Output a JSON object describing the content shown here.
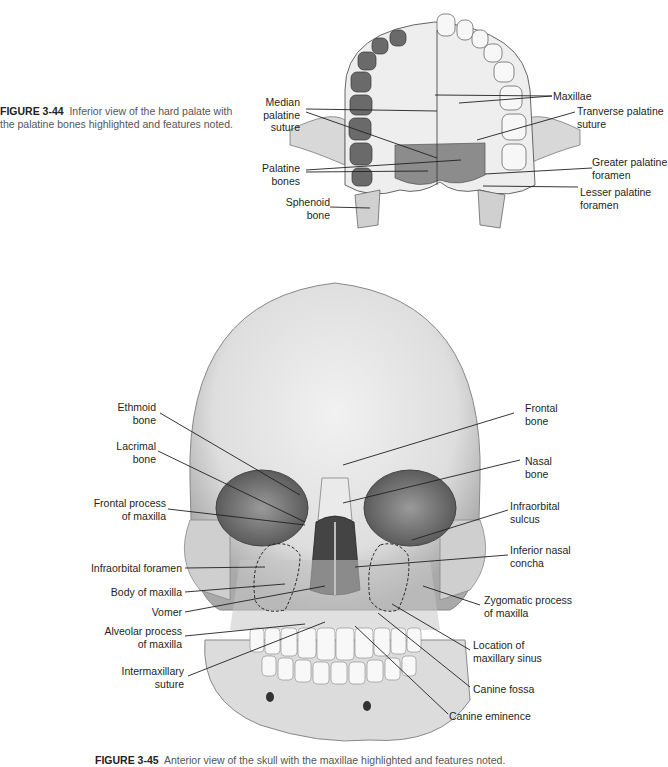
{
  "figure_344": {
    "caption_number": "FIGURE 3-44",
    "caption_text": "Inferior view of the hard palate with the palatine bones highlighted and features noted.",
    "labels": {
      "median_palatine_suture": "Median\npalatine\nsuture",
      "palatine_bones": "Palatine\nbones",
      "sphenoid_bone": "Sphenoid\nbone",
      "maxillae": "Maxillae",
      "tranverse_palatine_suture": "Tranverse palatine\nsuture",
      "greater_palatine_foramen": "Greater palatine\nforamen",
      "lesser_palatine_foramen": "Lesser palatine\nforamen"
    }
  },
  "figure_345": {
    "caption_number": "FIGURE 3-45",
    "caption_text": "Anterior view of the skull with the maxillae highlighted and features noted.",
    "labels": {
      "ethmoid_bone": "Ethmoid\nbone",
      "lacrimal_bone": "Lacrimal\nbone",
      "frontal_process": "Frontal process\nof maxilla",
      "infraorbital_foramen": "Infraorbital foramen",
      "body_of_maxilla": "Body of maxilla",
      "vomer": "Vomer",
      "alveolar_process": "Alveolar process\nof maxilla",
      "intermaxillary_suture": "Intermaxillary\nsuture",
      "frontal_bone": "Frontal\nbone",
      "nasal_bone": "Nasal\nbone",
      "infraorbital_sulcus": "Infraorbital\nsulcus",
      "inferior_nasal_concha": "Inferior nasal\nconcha",
      "zygomatic_process": "Zygomatic process\nof maxilla",
      "location_maxillary_sinus": "Location of\nmaxillary sinus",
      "canine_fossa": "Canine fossa",
      "canine_eminence": "Canine eminence"
    }
  },
  "colors": {
    "highlight": "#8a8a8a",
    "bone": "#e6e6e6",
    "line": "#231f20"
  }
}
